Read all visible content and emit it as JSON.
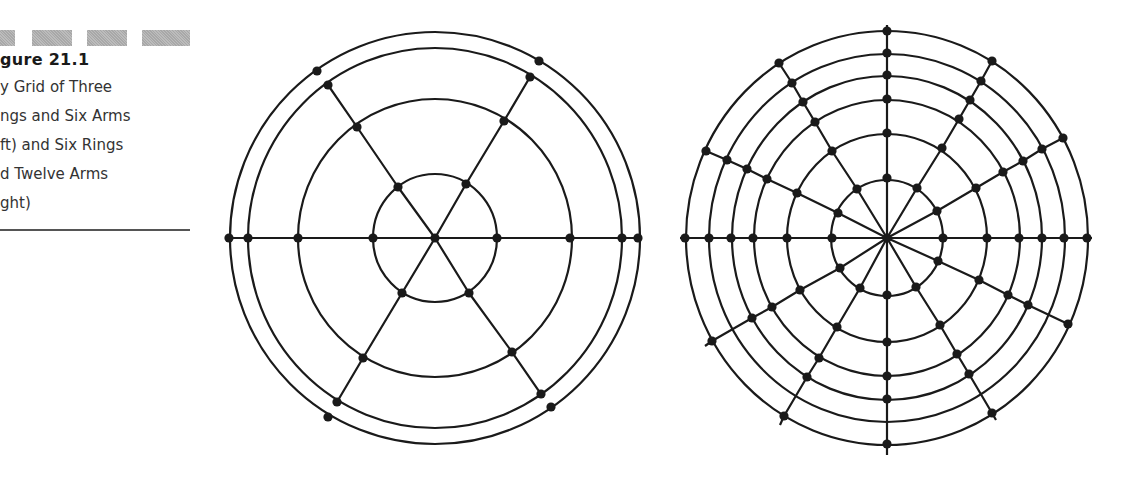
{
  "caption": {
    "title": "gure 21.1",
    "lines": [
      "y Grid of Three",
      "ngs and Six Arms",
      "ft) and Six Rings",
      "d Twelve Arms",
      "ght)"
    ]
  },
  "figures": {
    "left": {
      "label": "Three rings and six arms",
      "center": [
        435,
        238
      ],
      "rings": [
        [
          62,
          64
        ],
        [
          137,
          139
        ],
        [
          187,
          190
        ],
        [
          205,
          206
        ]
      ],
      "arms": [
        [
          [
            435,
            238
          ],
          [
            373,
            238
          ],
          [
            298,
            238
          ],
          [
            248,
            238
          ],
          [
            229,
            238
          ]
        ],
        [
          [
            435,
            238
          ],
          [
            497,
            238
          ],
          [
            570,
            238
          ],
          [
            622,
            238
          ],
          [
            638,
            238
          ]
        ],
        [
          [
            435,
            238
          ],
          [
            398,
            187
          ],
          [
            357,
            127
          ],
          [
            328,
            85
          ]
        ],
        [
          [
            435,
            238
          ],
          [
            466,
            184
          ],
          [
            504,
            121
          ],
          [
            530,
            77
          ]
        ],
        [
          [
            435,
            238
          ],
          [
            402,
            293
          ],
          [
            363,
            358
          ],
          [
            337,
            402
          ]
        ],
        [
          [
            435,
            238
          ],
          [
            469,
            293
          ],
          [
            512,
            352
          ],
          [
            541,
            394
          ]
        ]
      ],
      "dots": [
        [
          435,
          238
        ],
        [
          373,
          238
        ],
        [
          298,
          238
        ],
        [
          248,
          238
        ],
        [
          229,
          238
        ],
        [
          497,
          238
        ],
        [
          570,
          238
        ],
        [
          622,
          238
        ],
        [
          638,
          238
        ],
        [
          398,
          187
        ],
        [
          357,
          127
        ],
        [
          328,
          85
        ],
        [
          317,
          71
        ],
        [
          466,
          184
        ],
        [
          504,
          121
        ],
        [
          530,
          77
        ],
        [
          539,
          61
        ],
        [
          402,
          293
        ],
        [
          363,
          358
        ],
        [
          337,
          402
        ],
        [
          328,
          417
        ],
        [
          469,
          293
        ],
        [
          512,
          352
        ],
        [
          541,
          394
        ],
        [
          551,
          407
        ]
      ]
    },
    "right": {
      "label": "Six rings and twelve arms",
      "center": [
        887,
        238
      ],
      "rings": [
        [
          56,
          58
        ],
        [
          100,
          104
        ],
        [
          133,
          138
        ],
        [
          155,
          162
        ],
        [
          178,
          184
        ],
        [
          201,
          207
        ]
      ],
      "arms": [
        [
          [
            887,
            238
          ],
          [
            832,
            238
          ],
          [
            787,
            238
          ],
          [
            753,
            238
          ],
          [
            731,
            238
          ],
          [
            709,
            238
          ],
          [
            685,
            238
          ],
          [
            680,
            238
          ]
        ],
        [
          [
            887,
            238
          ],
          [
            943,
            238
          ],
          [
            987,
            238
          ],
          [
            1019,
            238
          ],
          [
            1042,
            238
          ],
          [
            1064,
            238
          ],
          [
            1087,
            238
          ],
          [
            1092,
            238
          ]
        ],
        [
          [
            887,
            238
          ],
          [
            887,
            178
          ],
          [
            887,
            133
          ],
          [
            887,
            99
          ],
          [
            887,
            75
          ],
          [
            887,
            53
          ],
          [
            887,
            31
          ],
          [
            887,
            25
          ]
        ],
        [
          [
            887,
            238
          ],
          [
            887,
            295
          ],
          [
            887,
            342
          ],
          [
            887,
            376
          ],
          [
            887,
            399
          ],
          [
            887,
            420
          ],
          [
            887,
            444
          ],
          [
            887,
            455
          ]
        ],
        [
          [
            887,
            238
          ],
          [
            857,
            189
          ],
          [
            832,
            151
          ],
          [
            815,
            122
          ],
          [
            803,
            102
          ],
          [
            792,
            83
          ],
          [
            779,
            63
          ]
        ],
        [
          [
            887,
            238
          ],
          [
            838,
            213
          ],
          [
            797,
            193
          ],
          [
            767,
            179
          ],
          [
            747,
            169
          ],
          [
            727,
            160
          ],
          [
            706,
            151
          ]
        ],
        [
          [
            887,
            238
          ],
          [
            917,
            188
          ],
          [
            942,
            148
          ],
          [
            959,
            119
          ],
          [
            970,
            100
          ],
          [
            981,
            81
          ],
          [
            992,
            61
          ]
        ],
        [
          [
            887,
            238
          ],
          [
            937,
            211
          ],
          [
            976,
            188
          ],
          [
            1003,
            172
          ],
          [
            1023,
            161
          ],
          [
            1042,
            149
          ],
          [
            1063,
            138
          ]
        ],
        [
          [
            887,
            238
          ],
          [
            840,
            268
          ],
          [
            800,
            290
          ],
          [
            772,
            307
          ],
          [
            752,
            318
          ],
          [
            712,
            341
          ],
          [
            705,
            346
          ]
        ],
        [
          [
            887,
            238
          ],
          [
            860,
            288
          ],
          [
            837,
            327
          ],
          [
            819,
            358
          ],
          [
            807,
            377
          ],
          [
            784,
            416
          ],
          [
            780,
            425
          ]
        ],
        [
          [
            887,
            238
          ],
          [
            938,
            261
          ],
          [
            979,
            280
          ],
          [
            1008,
            295
          ],
          [
            1028,
            305
          ],
          [
            1068,
            324
          ]
        ],
        [
          [
            887,
            238
          ],
          [
            916,
            287
          ],
          [
            940,
            325
          ],
          [
            957,
            354
          ],
          [
            969,
            374
          ],
          [
            992,
            413
          ],
          [
            996,
            420
          ]
        ]
      ],
      "dots": [
        [
          887,
          238
        ],
        [
          832,
          238
        ],
        [
          787,
          238
        ],
        [
          753,
          238
        ],
        [
          731,
          238
        ],
        [
          709,
          238
        ],
        [
          685,
          238
        ],
        [
          943,
          238
        ],
        [
          987,
          238
        ],
        [
          1019,
          238
        ],
        [
          1042,
          238
        ],
        [
          1064,
          238
        ],
        [
          1087,
          238
        ],
        [
          887,
          178
        ],
        [
          887,
          133
        ],
        [
          887,
          99
        ],
        [
          887,
          75
        ],
        [
          887,
          53
        ],
        [
          887,
          31
        ],
        [
          887,
          295
        ],
        [
          887,
          342
        ],
        [
          887,
          376
        ],
        [
          887,
          399
        ],
        [
          887,
          444
        ],
        [
          857,
          189
        ],
        [
          832,
          151
        ],
        [
          815,
          122
        ],
        [
          803,
          102
        ],
        [
          792,
          83
        ],
        [
          779,
          63
        ],
        [
          838,
          213
        ],
        [
          797,
          193
        ],
        [
          767,
          179
        ],
        [
          747,
          169
        ],
        [
          727,
          160
        ],
        [
          706,
          151
        ],
        [
          917,
          188
        ],
        [
          942,
          148
        ],
        [
          959,
          119
        ],
        [
          970,
          100
        ],
        [
          981,
          81
        ],
        [
          992,
          61
        ],
        [
          937,
          211
        ],
        [
          976,
          188
        ],
        [
          1003,
          172
        ],
        [
          1023,
          161
        ],
        [
          1042,
          149
        ],
        [
          1063,
          138
        ],
        [
          840,
          268
        ],
        [
          800,
          290
        ],
        [
          772,
          307
        ],
        [
          752,
          318
        ],
        [
          712,
          341
        ],
        [
          860,
          288
        ],
        [
          837,
          327
        ],
        [
          819,
          358
        ],
        [
          807,
          377
        ],
        [
          784,
          416
        ],
        [
          938,
          261
        ],
        [
          979,
          280
        ],
        [
          1008,
          295
        ],
        [
          1028,
          305
        ],
        [
          1068,
          324
        ],
        [
          916,
          287
        ],
        [
          940,
          325
        ],
        [
          957,
          354
        ],
        [
          969,
          374
        ],
        [
          992,
          413
        ]
      ]
    }
  },
  "style": {
    "stroke": "#1a1a1a",
    "dot": "#1a1a1a",
    "bar_gray": "#b3b3b3"
  }
}
